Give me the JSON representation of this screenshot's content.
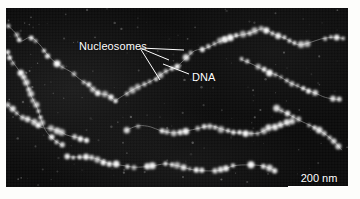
{
  "figure": {
    "type": "electron-micrograph",
    "background_color": "#fdfdfb",
    "plate_color": "#0a0a0a",
    "annotation_color": "#ffffff"
  },
  "annotations": {
    "nucleosomes_label": "Nucleosomes",
    "dna_label": "DNA"
  },
  "scalebar": {
    "label": "200 nm",
    "length_px": 62
  },
  "leader_lines": {
    "nucleosomes": [
      {
        "x1": 134,
        "y1": 40,
        "x2": 178,
        "y2": 42
      },
      {
        "x1": 134,
        "y1": 40,
        "x2": 163,
        "y2": 52
      },
      {
        "x1": 134,
        "y1": 40,
        "x2": 154,
        "y2": 72
      }
    ],
    "dna": [
      {
        "x1": 183,
        "y1": 66,
        "x2": 157,
        "y2": 56
      }
    ]
  },
  "chart_data": {
    "type": "scatter",
    "title": "",
    "xlabel": "",
    "ylabel": "",
    "scale_nm_per_bar": 200,
    "fibers": [
      {
        "name": "fiber-upper-left",
        "points": [
          [
            2,
            18
          ],
          [
            10,
            26
          ],
          [
            16,
            34
          ],
          [
            24,
            30
          ],
          [
            33,
            36
          ],
          [
            40,
            46
          ],
          [
            48,
            52
          ],
          [
            57,
            58
          ],
          [
            66,
            64
          ],
          [
            74,
            72
          ],
          [
            83,
            78
          ],
          [
            92,
            84
          ],
          [
            101,
            88
          ],
          [
            110,
            92
          ]
        ]
      },
      {
        "name": "fiber-left-edge",
        "points": [
          [
            2,
            44
          ],
          [
            8,
            54
          ],
          [
            14,
            64
          ],
          [
            20,
            76
          ],
          [
            26,
            88
          ],
          [
            30,
            100
          ],
          [
            34,
            112
          ],
          [
            40,
            122
          ],
          [
            47,
            130
          ],
          [
            55,
            136
          ]
        ]
      },
      {
        "name": "fiber-left-lower",
        "points": [
          [
            2,
            96
          ],
          [
            9,
            104
          ],
          [
            17,
            110
          ],
          [
            26,
            114
          ],
          [
            35,
            118
          ],
          [
            44,
            120
          ],
          [
            53,
            124
          ],
          [
            62,
            128
          ],
          [
            71,
            130
          ],
          [
            80,
            132
          ]
        ]
      },
      {
        "name": "fiber-center-upper",
        "points": [
          [
            110,
            92
          ],
          [
            120,
            86
          ],
          [
            130,
            80
          ],
          [
            140,
            74
          ],
          [
            150,
            70
          ],
          [
            160,
            64
          ],
          [
            170,
            58
          ],
          [
            180,
            50
          ],
          [
            190,
            44
          ],
          [
            200,
            40
          ],
          [
            210,
            36
          ],
          [
            220,
            32
          ]
        ]
      },
      {
        "name": "fiber-center",
        "points": [
          [
            120,
            122
          ],
          [
            132,
            118
          ],
          [
            144,
            120
          ],
          [
            156,
            124
          ],
          [
            168,
            126
          ],
          [
            180,
            124
          ],
          [
            192,
            120
          ],
          [
            204,
            118
          ],
          [
            216,
            120
          ],
          [
            228,
            124
          ],
          [
            240,
            126
          ],
          [
            252,
            124
          ],
          [
            264,
            120
          ],
          [
            276,
            116
          ],
          [
            288,
            114
          ]
        ]
      },
      {
        "name": "fiber-lower",
        "points": [
          [
            60,
            150
          ],
          [
            74,
            148
          ],
          [
            88,
            150
          ],
          [
            102,
            154
          ],
          [
            116,
            158
          ],
          [
            130,
            160
          ],
          [
            144,
            158
          ],
          [
            158,
            156
          ],
          [
            172,
            158
          ],
          [
            186,
            162
          ],
          [
            200,
            164
          ],
          [
            214,
            162
          ],
          [
            228,
            158
          ],
          [
            242,
            156
          ],
          [
            256,
            158
          ],
          [
            270,
            162
          ]
        ]
      },
      {
        "name": "fiber-right-upper",
        "points": [
          [
            220,
            32
          ],
          [
            232,
            28
          ],
          [
            244,
            24
          ],
          [
            256,
            22
          ],
          [
            268,
            26
          ],
          [
            280,
            32
          ],
          [
            292,
            36
          ],
          [
            304,
            34
          ],
          [
            316,
            30
          ],
          [
            328,
            28
          ],
          [
            338,
            30
          ]
        ]
      },
      {
        "name": "fiber-right-mid",
        "points": [
          [
            236,
            52
          ],
          [
            248,
            56
          ],
          [
            260,
            62
          ],
          [
            272,
            68
          ],
          [
            284,
            74
          ],
          [
            296,
            80
          ],
          [
            308,
            86
          ],
          [
            320,
            90
          ],
          [
            332,
            92
          ]
        ]
      },
      {
        "name": "fiber-right-lower",
        "points": [
          [
            270,
            100
          ],
          [
            282,
            106
          ],
          [
            294,
            112
          ],
          [
            306,
            118
          ],
          [
            318,
            126
          ],
          [
            328,
            134
          ],
          [
            336,
            142
          ]
        ]
      }
    ]
  }
}
